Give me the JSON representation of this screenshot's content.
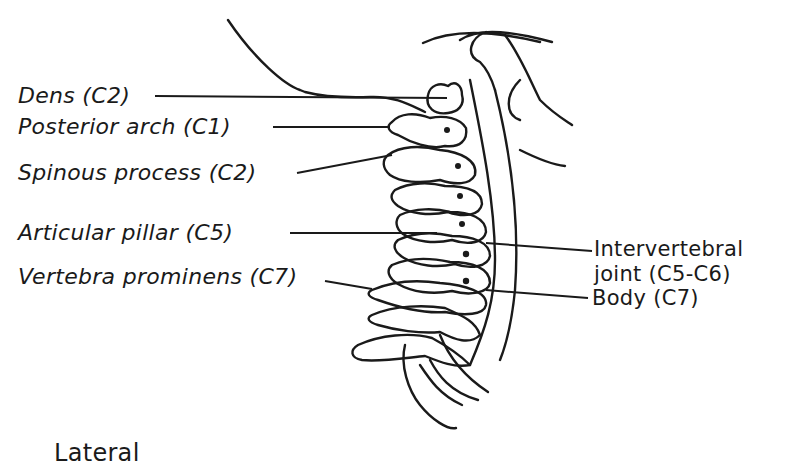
{
  "figure": {
    "view_caption": "Lateral",
    "ink_color": "#1a1a1a",
    "background_color": "#ffffff"
  },
  "labels_left": [
    {
      "id": "dens",
      "text": "Dens (C2)"
    },
    {
      "id": "posterior-arch",
      "text": "Posterior arch (C1)"
    },
    {
      "id": "spinous-process",
      "text": "Spinous process (C2)"
    },
    {
      "id": "articular-pillar",
      "text": "Articular pillar (C5)"
    },
    {
      "id": "vertebra-prominens",
      "text": "Vertebra prominens (C7)"
    }
  ],
  "labels_right": [
    {
      "id": "intervertebral-joint",
      "line1": "Intervertebral",
      "line2": "joint (C5-C6)"
    },
    {
      "id": "body",
      "text": "Body (C7)"
    }
  ]
}
